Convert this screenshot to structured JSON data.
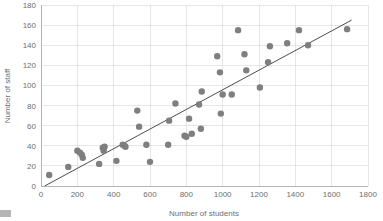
{
  "chart_data": {
    "type": "scatter",
    "title": "",
    "xlabel": "Number of students",
    "ylabel": "Number of staff",
    "xlim": [
      0,
      1800
    ],
    "ylim": [
      0,
      180
    ],
    "xticks": [
      0,
      200,
      400,
      600,
      800,
      1000,
      1200,
      1400,
      1600,
      1800
    ],
    "yticks": [
      0,
      20,
      40,
      60,
      80,
      100,
      120,
      140,
      160,
      180
    ],
    "xtick_labels": [
      "0",
      "200",
      "400",
      "600",
      "800",
      "1000",
      "1200",
      "1400",
      "1600",
      "1800"
    ],
    "ytick_labels": [
      "0",
      "20",
      "40",
      "60",
      "80",
      "100",
      "120",
      "140",
      "160",
      "180"
    ],
    "grid": true,
    "legend": false,
    "point_color": "#7f7f7f",
    "trendline_color": "#4d4d4d",
    "gridline_color": "#d6d6d6",
    "series": [
      {
        "name": "Schools",
        "points": [
          [
            45,
            11
          ],
          [
            150,
            19
          ],
          [
            200,
            35
          ],
          [
            215,
            33
          ],
          [
            225,
            31
          ],
          [
            230,
            28
          ],
          [
            320,
            22
          ],
          [
            340,
            38
          ],
          [
            345,
            35
          ],
          [
            350,
            39
          ],
          [
            415,
            25
          ],
          [
            450,
            41
          ],
          [
            460,
            40
          ],
          [
            465,
            39
          ],
          [
            530,
            75
          ],
          [
            540,
            59
          ],
          [
            580,
            41
          ],
          [
            600,
            24
          ],
          [
            700,
            41
          ],
          [
            705,
            65
          ],
          [
            740,
            82
          ],
          [
            790,
            50
          ],
          [
            800,
            49
          ],
          [
            815,
            67
          ],
          [
            830,
            52
          ],
          [
            870,
            81
          ],
          [
            880,
            57
          ],
          [
            885,
            94
          ],
          [
            970,
            129
          ],
          [
            985,
            113
          ],
          [
            990,
            72
          ],
          [
            1000,
            91
          ],
          [
            1050,
            91
          ],
          [
            1085,
            155
          ],
          [
            1120,
            131
          ],
          [
            1130,
            115
          ],
          [
            1205,
            98
          ],
          [
            1250,
            123
          ],
          [
            1260,
            139
          ],
          [
            1355,
            142
          ],
          [
            1420,
            155
          ],
          [
            1470,
            140
          ],
          [
            1685,
            156
          ]
        ]
      }
    ],
    "trendline": {
      "x0": 20,
      "y0": 0,
      "x1": 1710,
      "y1": 165
    }
  }
}
